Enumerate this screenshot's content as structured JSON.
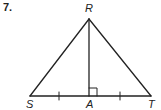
{
  "problem": {
    "number": "7."
  },
  "figure": {
    "type": "triangle",
    "vertices": {
      "R": {
        "label": "R",
        "x": 89,
        "y": 19
      },
      "S": {
        "label": "S",
        "x": 30,
        "y": 96
      },
      "T": {
        "label": "T",
        "x": 151,
        "y": 96
      },
      "A": {
        "label": "A",
        "x": 89,
        "y": 96
      }
    },
    "segments": [
      "RS",
      "RT",
      "ST",
      "RA"
    ],
    "marks": {
      "right_angle_at": "A",
      "congruent_ticks": [
        "SA",
        "AT"
      ]
    },
    "colors": {
      "stroke": "#222222",
      "background": "#ffffff"
    }
  }
}
